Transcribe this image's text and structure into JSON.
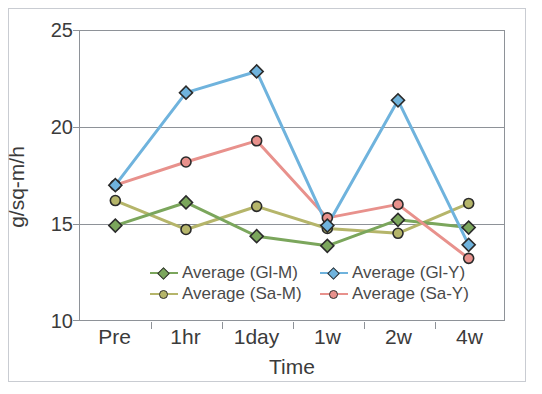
{
  "chart_data": {
    "type": "line",
    "title": "",
    "xlabel": "Time",
    "ylabel": "g/sq-m/h",
    "categories": [
      "Pre",
      "1hr",
      "1day",
      "1w",
      "2w",
      "4w"
    ],
    "ylim": [
      10,
      25
    ],
    "yticks": [
      10,
      15,
      20,
      25
    ],
    "ytick_labels": [
      "10",
      "15",
      "20",
      "25"
    ],
    "grid": true,
    "legend_position": "inside-bottom-center",
    "series": [
      {
        "name": "Average (Gl-M)",
        "color": "#7ba65c",
        "marker": "diamond",
        "values": [
          14.9,
          16.1,
          14.35,
          13.85,
          15.2,
          14.8
        ]
      },
      {
        "name": "Average (Gl-Y)",
        "color": "#6fb3dd",
        "marker": "diamond",
        "values": [
          17.0,
          21.8,
          22.9,
          14.9,
          21.4,
          13.9
        ]
      },
      {
        "name": "Average (Sa-M)",
        "color": "#b5b56a",
        "marker": "circle",
        "values": [
          16.2,
          14.7,
          15.9,
          14.75,
          14.5,
          16.05
        ]
      },
      {
        "name": "Average (Sa-Y)",
        "color": "#e8918c",
        "marker": "circle",
        "values": [
          17.0,
          18.2,
          19.3,
          15.3,
          16.0,
          13.2
        ]
      }
    ]
  },
  "legend": {
    "entries": [
      {
        "label": "Average (Gl-M)"
      },
      {
        "label": "Average (Gl-Y)"
      },
      {
        "label": "Average (Sa-M)"
      },
      {
        "label": "Average (Sa-Y)"
      }
    ]
  },
  "axes": {
    "y_title": "g/sq-m/h",
    "x_title": "Time",
    "y_tick_0": "25",
    "y_tick_1": "20",
    "y_tick_2": "15",
    "y_tick_3": "10",
    "x_tick_0": "Pre",
    "x_tick_1": "1hr",
    "x_tick_2": "1day",
    "x_tick_3": "1w",
    "x_tick_4": "2w",
    "x_tick_5": "4w"
  }
}
